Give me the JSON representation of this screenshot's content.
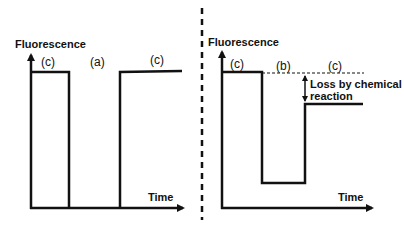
{
  "left_panel": {
    "y_axis_label": "Fluorescence",
    "x_axis_label": "Time",
    "regions": [
      {
        "id": "c1",
        "label": "(c)"
      },
      {
        "id": "a",
        "label": "(a)"
      },
      {
        "id": "c2",
        "label": "(c)"
      }
    ]
  },
  "right_panel": {
    "y_axis_label": "Fluorescence",
    "x_axis_label": "Time",
    "regions": [
      {
        "id": "c1",
        "label": "(c)"
      },
      {
        "id": "b",
        "label": "(b)"
      },
      {
        "id": "c2",
        "label": "(c)"
      }
    ],
    "annotation_line1": "Loss by chemical",
    "annotation_line2": "reaction"
  },
  "colors": {
    "line": "#111111",
    "background": "#ffffff"
  }
}
